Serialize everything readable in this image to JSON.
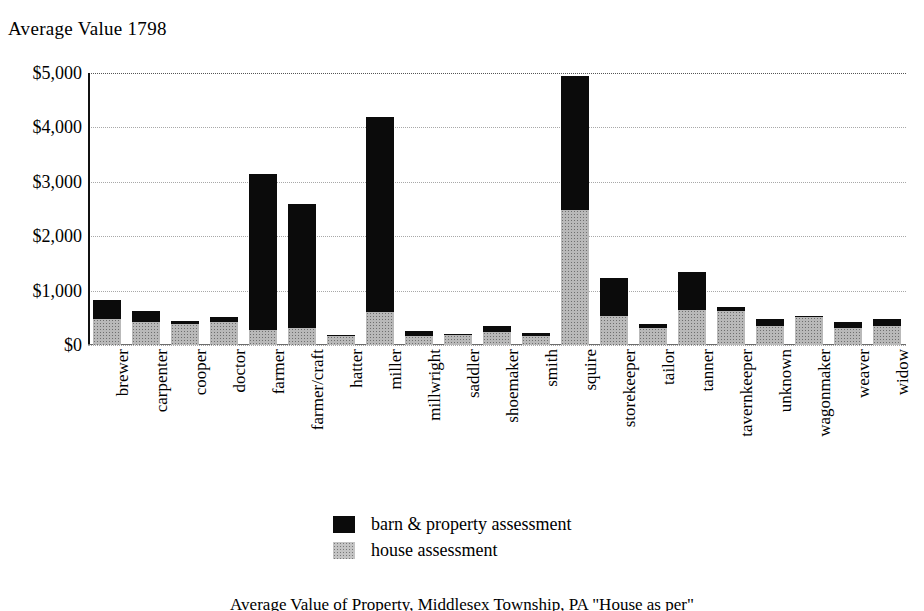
{
  "chart_data": {
    "type": "bar",
    "title": "Average Value 1798",
    "subtitle": "",
    "xlabel": "",
    "ylabel": "",
    "ylim": [
      0,
      5000
    ],
    "ytick_labels": [
      "$5,000",
      "$4,000",
      "$3,000",
      "$2,000",
      "$1,000",
      "$0"
    ],
    "ytick_values": [
      5000,
      4000,
      3000,
      2000,
      1000,
      0
    ],
    "grid": "horizontal-dotted",
    "stacked": true,
    "legend_position": "bottom-center",
    "categories": [
      "brewer",
      "carpenter",
      "cooper",
      "doctor",
      "farmer",
      "farmer/craft",
      "hatter",
      "miller",
      "millwright",
      "saddler",
      "shoemaker",
      "smith",
      "squire",
      "storekeeper",
      "tailor",
      "tanner",
      "tavernkeeper",
      "unknown",
      "wagonmaker",
      "weaver",
      "widow"
    ],
    "series": [
      {
        "name": "house assessment",
        "color": "#c4c4c4",
        "values": [
          480,
          430,
          380,
          430,
          280,
          320,
          170,
          600,
          170,
          180,
          240,
          160,
          2480,
          540,
          320,
          650,
          630,
          350,
          520,
          310,
          350
        ]
      },
      {
        "name": "barn & property assessment",
        "color": "#0b0b0b",
        "values": [
          350,
          200,
          60,
          90,
          2860,
          2280,
          20,
          3600,
          90,
          30,
          110,
          70,
          2470,
          690,
          70,
          700,
          60,
          130,
          10,
          110,
          130
        ]
      }
    ],
    "totals": [
      830,
      630,
      440,
      520,
      3140,
      2600,
      190,
      4200,
      260,
      210,
      350,
      230,
      4950,
      1230,
      390,
      1350,
      690,
      480,
      530,
      420,
      480
    ]
  },
  "legend": {
    "items": [
      {
        "label": "barn & property assessment",
        "swatch": "black-solid"
      },
      {
        "label": "house assessment",
        "swatch": "gray-stipple"
      }
    ]
  },
  "caption": {
    "text": "Average Value of Property, Middlesex Township, PA \"House as per\""
  }
}
